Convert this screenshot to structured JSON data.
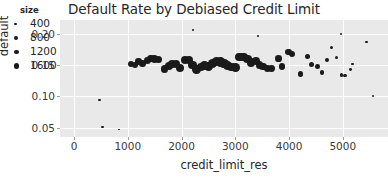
{
  "chart_data": {
    "type": "scatter",
    "title": "Default Rate by Debiased Credit Limit",
    "xlabel": "credit_limit_res",
    "ylabel": "default",
    "xlim": [
      -260,
      5840
    ],
    "ylim": [
      0.035,
      0.222
    ],
    "grid": true,
    "xticks": [
      0,
      1000,
      2000,
      3000,
      4000,
      5000
    ],
    "xticklabels": [
      "0",
      "1000",
      "2000",
      "3000",
      "4000",
      "5000"
    ],
    "yticks": [
      0.05,
      0.1,
      0.15,
      0.2
    ],
    "yticklabels": [
      "0.05",
      "0.10",
      "0.15",
      "0.20"
    ],
    "legend": {
      "title": "size",
      "position": "upper left",
      "entries": [
        {
          "label": "400",
          "size": 400
        },
        {
          "label": "800",
          "size": 800
        },
        {
          "label": "1200",
          "size": 1200
        },
        {
          "label": "1600",
          "size": 1600
        }
      ]
    },
    "series": [
      {
        "name": "default by credit_limit_res",
        "marker_color": "#1a1a1a",
        "points": [
          {
            "x": 480,
            "y": 0.094,
            "size": 120
          },
          {
            "x": 530,
            "y": 0.051,
            "size": 130
          },
          {
            "x": 1060,
            "y": 0.152,
            "size": 620
          },
          {
            "x": 1130,
            "y": 0.15,
            "size": 640
          },
          {
            "x": 1200,
            "y": 0.156,
            "size": 700
          },
          {
            "x": 1280,
            "y": 0.152,
            "size": 740
          },
          {
            "x": 1360,
            "y": 0.157,
            "size": 820
          },
          {
            "x": 1430,
            "y": 0.16,
            "size": 900
          },
          {
            "x": 1500,
            "y": 0.16,
            "size": 940
          },
          {
            "x": 1570,
            "y": 0.159,
            "size": 900
          },
          {
            "x": 1680,
            "y": 0.144,
            "size": 980
          },
          {
            "x": 1760,
            "y": 0.148,
            "size": 1020
          },
          {
            "x": 1830,
            "y": 0.151,
            "size": 1060
          },
          {
            "x": 1900,
            "y": 0.151,
            "size": 1080
          },
          {
            "x": 1980,
            "y": 0.146,
            "size": 1060
          },
          {
            "x": 2070,
            "y": 0.158,
            "size": 1200
          },
          {
            "x": 2140,
            "y": 0.158,
            "size": 1240
          },
          {
            "x": 2210,
            "y": 0.15,
            "size": 1260
          },
          {
            "x": 2280,
            "y": 0.143,
            "size": 1200
          },
          {
            "x": 2360,
            "y": 0.147,
            "size": 1260
          },
          {
            "x": 2430,
            "y": 0.149,
            "size": 1300
          },
          {
            "x": 2500,
            "y": 0.148,
            "size": 1320
          },
          {
            "x": 2580,
            "y": 0.153,
            "size": 1380
          },
          {
            "x": 2650,
            "y": 0.156,
            "size": 1420
          },
          {
            "x": 2720,
            "y": 0.155,
            "size": 1440
          },
          {
            "x": 2790,
            "y": 0.152,
            "size": 1400
          },
          {
            "x": 2860,
            "y": 0.149,
            "size": 1340
          },
          {
            "x": 2930,
            "y": 0.147,
            "size": 1300
          },
          {
            "x": 3000,
            "y": 0.146,
            "size": 1260
          },
          {
            "x": 3080,
            "y": 0.163,
            "size": 1280
          },
          {
            "x": 3150,
            "y": 0.163,
            "size": 1240
          },
          {
            "x": 3230,
            "y": 0.16,
            "size": 1180
          },
          {
            "x": 3300,
            "y": 0.154,
            "size": 1120
          },
          {
            "x": 3380,
            "y": 0.156,
            "size": 1080
          },
          {
            "x": 3450,
            "y": 0.15,
            "size": 1020
          },
          {
            "x": 3520,
            "y": 0.148,
            "size": 960
          },
          {
            "x": 3600,
            "y": 0.144,
            "size": 880
          },
          {
            "x": 3680,
            "y": 0.145,
            "size": 820
          },
          {
            "x": 3800,
            "y": 0.16,
            "size": 760
          },
          {
            "x": 3870,
            "y": 0.148,
            "size": 700
          },
          {
            "x": 3990,
            "y": 0.171,
            "size": 640
          },
          {
            "x": 4050,
            "y": 0.168,
            "size": 600
          },
          {
            "x": 4210,
            "y": 0.136,
            "size": 520
          },
          {
            "x": 4340,
            "y": 0.164,
            "size": 460
          },
          {
            "x": 4420,
            "y": 0.151,
            "size": 420
          },
          {
            "x": 4530,
            "y": 0.148,
            "size": 380
          },
          {
            "x": 4610,
            "y": 0.138,
            "size": 340
          },
          {
            "x": 4700,
            "y": 0.158,
            "size": 300
          },
          {
            "x": 4790,
            "y": 0.178,
            "size": 260
          },
          {
            "x": 4880,
            "y": 0.162,
            "size": 230
          },
          {
            "x": 4980,
            "y": 0.134,
            "size": 190
          },
          {
            "x": 5040,
            "y": 0.133,
            "size": 170
          },
          {
            "x": 5150,
            "y": 0.143,
            "size": 140
          },
          {
            "x": 5180,
            "y": 0.152,
            "size": 110
          },
          {
            "x": 5440,
            "y": 0.187,
            "size": 90
          },
          {
            "x": 5560,
            "y": 0.101,
            "size": 80
          },
          {
            "x": 3420,
            "y": 0.196,
            "size": 60
          },
          {
            "x": 4960,
            "y": 0.2,
            "size": 60
          },
          {
            "x": 2210,
            "y": 0.206,
            "size": 55
          },
          {
            "x": 830,
            "y": 0.047,
            "size": 60
          }
        ]
      }
    ]
  }
}
